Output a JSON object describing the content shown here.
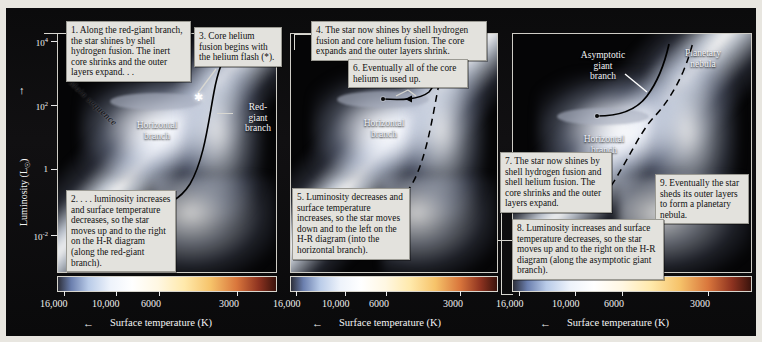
{
  "axes": {
    "ylabel": "Luminosity (L",
    "ylabel_sub": "☉",
    "ylabel_close": ")",
    "yticks": [
      "10",
      "10",
      "1",
      "10"
    ],
    "yticks_exp": [
      "4",
      "2",
      "",
      "-2"
    ],
    "xticks": [
      "16,000",
      "10,000",
      "6000",
      "3000"
    ],
    "xlabel": "Surface temperature (K)",
    "xarrow": "←",
    "yarrow": "↑"
  },
  "labels": {
    "main_sequence": "Main sequence",
    "horizontal_branch": "Horizontal\nbranch",
    "horizontal_branch_l1": "Horizontal",
    "horizontal_branch_l2": "branch",
    "red_giant_l1": "Red-",
    "red_giant_l2": "giant",
    "red_giant_l3": "branch",
    "asymptotic_l1": "Asymptotic",
    "asymptotic_l2": "giant",
    "asymptotic_l3": "branch",
    "planetary_l1": "Planetary",
    "planetary_l2": "nebula"
  },
  "panels": [
    {
      "id": "panel-1",
      "callouts": [
        {
          "id": "callout-1",
          "text": "1. Along the red-giant branch, the star shines by shell hydrogen fusion. The inert core shrinks and the outer layers expand. . ."
        },
        {
          "id": "callout-2",
          "text": "2. . . . luminosity increases and surface temperature decreases, so the star moves up and to the right on the H-R diagram (along the red-giant branch)."
        }
      ]
    },
    {
      "id": "panel-2",
      "callouts": [
        {
          "id": "callout-3",
          "text": "3. Core helium fusion begins with the helium flash (*)."
        },
        {
          "id": "callout-4",
          "text": "4. The star now shines by shell hydrogen fusion and core helium fusion. The core expands and the outer layers shrink."
        },
        {
          "id": "callout-5",
          "text": "5. Luminosity decreases and surface temperature increases, so the star moves down and to the left on the H-R diagram (into the horizontal branch)."
        },
        {
          "id": "callout-6",
          "text": "6. Eventually all of the core helium is used up."
        }
      ]
    },
    {
      "id": "panel-3",
      "callouts": [
        {
          "id": "callout-7",
          "text": "7. The star now shines by shell hydrogen fusion and shell helium fusion. The core shrinks and the outer layers expand."
        },
        {
          "id": "callout-8",
          "text": "8. Luminosity increases and surface temperature decreases, so the star moves up and to the right on the H-R diagram (along the asymptotic giant branch)."
        },
        {
          "id": "callout-9",
          "text": "9. Eventually the star sheds its outer layers to form a planetary nebula."
        }
      ]
    }
  ],
  "colors": {
    "callout_bg": "#e3e2dd",
    "callout_border": "#9b9a93",
    "panel_bg": "#050506",
    "axis_text": "#f0f0f0",
    "figure_bg": "#e8e6e0"
  }
}
